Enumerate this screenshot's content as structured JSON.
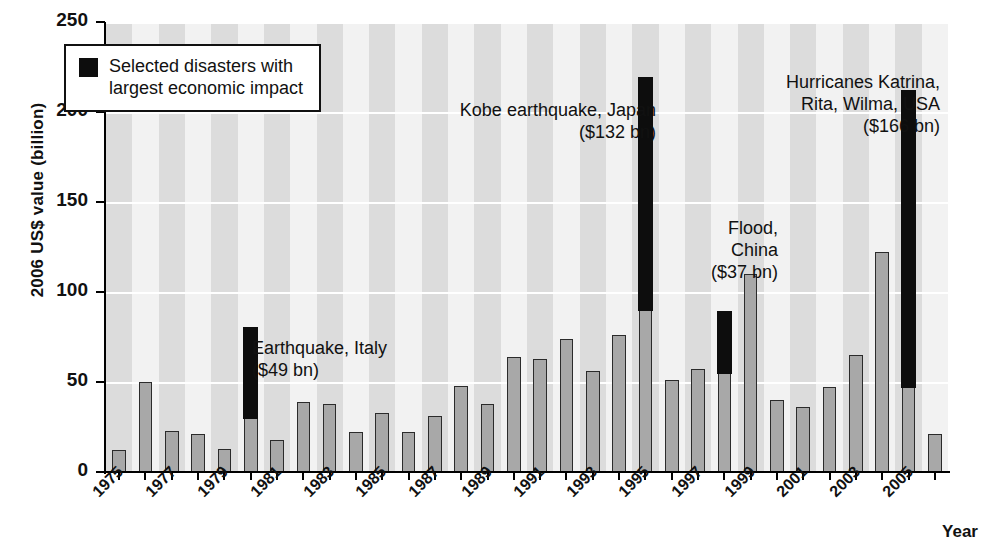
{
  "chart_data": {
    "type": "bar",
    "title": "",
    "xlabel": "Year",
    "ylabel": "2006 US$ value (billion)",
    "ylim": [
      0,
      250
    ],
    "yticks": [
      0,
      50,
      100,
      150,
      200,
      250
    ],
    "grid": "horizontal-white-lines-and-vertical-shaded-bands",
    "legend": {
      "position": "top-left-inside",
      "entries": [
        {
          "label": "Selected disasters with\nlargest economic impact",
          "color": "#0d0d0d"
        }
      ]
    },
    "series": [
      {
        "name": "Total economic losses",
        "color": "#a8a8a8"
      },
      {
        "name": "Selected disasters with largest economic impact",
        "color": "#0d0d0d"
      }
    ],
    "categories": [
      1975,
      1976,
      1977,
      1978,
      1979,
      1980,
      1981,
      1982,
      1983,
      1984,
      1985,
      1986,
      1987,
      1988,
      1989,
      1990,
      1991,
      1992,
      1993,
      1994,
      1995,
      1996,
      1997,
      1998,
      1999,
      2000,
      2001,
      2002,
      2003,
      2004,
      2005,
      2006
    ],
    "xtick_labels": [
      "1975",
      "1977",
      "1979",
      "1981",
      "1983",
      "1985",
      "1987",
      "1989",
      "1991",
      "1993",
      "1995",
      "1997",
      "1999",
      "2001",
      "2003",
      "2005"
    ],
    "values": [
      12,
      50,
      23,
      21,
      13,
      80,
      18,
      39,
      38,
      22,
      33,
      22,
      31,
      48,
      38,
      64,
      63,
      74,
      56,
      76,
      219,
      51,
      57,
      89,
      110,
      40,
      36,
      47,
      65,
      122,
      212,
      21
    ],
    "base_values": [
      12,
      50,
      23,
      21,
      13,
      30,
      18,
      39,
      38,
      22,
      33,
      22,
      31,
      48,
      38,
      64,
      63,
      74,
      56,
      76,
      90,
      51,
      57,
      55,
      110,
      40,
      36,
      47,
      65,
      122,
      47,
      21
    ],
    "highlighted": [
      {
        "year": 1980,
        "base": 30,
        "total": 80,
        "label": "Earthquake, Italy\n($49 bn)"
      },
      {
        "year": 1995,
        "base": 90,
        "total": 219,
        "label": "Kobe earthquake, Japan\n($132 bn)"
      },
      {
        "year": 1998,
        "base": 55,
        "total": 89,
        "label": "Flood,\nChina\n($37 bn)"
      },
      {
        "year": 2005,
        "base": 47,
        "total": 212,
        "label": "Hurricanes Katrina,\nRita, Wilma, USA\n($166 bn)"
      }
    ],
    "annotations": [
      {
        "name": "annotation-earthquake-italy",
        "text": "Earthquake, Italy\n($49 bn)",
        "align": "left"
      },
      {
        "name": "annotation-kobe-earthquake",
        "text": "Kobe earthquake, Japan\n($132 bn)",
        "align": "right"
      },
      {
        "name": "annotation-flood-china",
        "text": "Flood,\nChina\n($37 bn)",
        "align": "right"
      },
      {
        "name": "annotation-hurricanes-katrina",
        "text": "Hurricanes Katrina,\nRita, Wilma, USA\n($166 bn)",
        "align": "right"
      }
    ]
  },
  "axes": {
    "y_title": "2006 US$ value (billion)",
    "x_title": "Year",
    "y_ticks": [
      "0",
      "50",
      "100",
      "150",
      "200",
      "250"
    ]
  },
  "legend": {
    "text": "Selected disasters with\nlargest economic impact"
  },
  "colors": {
    "bar_fill": "#a8a8a8",
    "bar_edge": "#2b2b2b",
    "highlight": "#0d0d0d",
    "plot_bg": "#f2f2f2",
    "band": "#dcdcdc",
    "gridline": "#ffffff"
  }
}
